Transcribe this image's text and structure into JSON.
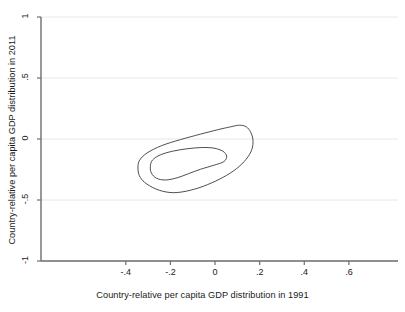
{
  "chart_data": {
    "type": "line",
    "title": "",
    "subtitle": "",
    "xlabel": "Country-relative per capita GDP distribution in 1991",
    "ylabel": "Country-relative per capita GDP distribution in 2011",
    "xlim": [
      -0.78,
      0.82
    ],
    "ylim": [
      -1.0,
      1.0
    ],
    "grid": true,
    "grid_axis": "y",
    "legend": "none",
    "xticks": [
      -0.4,
      -0.2,
      0,
      0.2,
      0.4,
      0.6
    ],
    "xtick_labels": [
      "-.4",
      "-.2",
      "0",
      ".2",
      ".4",
      ".6"
    ],
    "yticks": [
      1,
      0.5,
      0,
      -0.5,
      -1
    ],
    "ytick_labels": [
      "1",
      ".5",
      "0",
      "-.5",
      "-1"
    ],
    "series": [
      {
        "name": "outer-contour",
        "type": "closed-contour",
        "points": [
          [
            -0.345,
            -0.255
          ],
          [
            -0.34,
            -0.18
          ],
          [
            -0.305,
            -0.115
          ],
          [
            -0.24,
            -0.055
          ],
          [
            -0.155,
            -0.005
          ],
          [
            -0.065,
            0.04
          ],
          [
            0.01,
            0.075
          ],
          [
            0.07,
            0.1
          ],
          [
            0.11,
            0.113
          ],
          [
            0.14,
            0.1
          ],
          [
            0.16,
            0.055
          ],
          [
            0.17,
            -0.01
          ],
          [
            0.165,
            -0.085
          ],
          [
            0.14,
            -0.165
          ],
          [
            0.095,
            -0.245
          ],
          [
            0.035,
            -0.315
          ],
          [
            -0.035,
            -0.375
          ],
          [
            -0.11,
            -0.42
          ],
          [
            -0.185,
            -0.44
          ],
          [
            -0.25,
            -0.42
          ],
          [
            -0.305,
            -0.37
          ],
          [
            -0.335,
            -0.315
          ],
          [
            -0.345,
            -0.255
          ]
        ]
      },
      {
        "name": "inner-contour",
        "type": "closed-contour",
        "points": [
          [
            -0.29,
            -0.225
          ],
          [
            -0.28,
            -0.172
          ],
          [
            -0.245,
            -0.13
          ],
          [
            -0.19,
            -0.1
          ],
          [
            -0.125,
            -0.08
          ],
          [
            -0.06,
            -0.07
          ],
          [
            -0.005,
            -0.075
          ],
          [
            0.035,
            -0.1
          ],
          [
            0.052,
            -0.14
          ],
          [
            0.04,
            -0.185
          ],
          [
            -0.005,
            -0.215
          ],
          [
            -0.065,
            -0.248
          ],
          [
            -0.12,
            -0.285
          ],
          [
            -0.17,
            -0.318
          ],
          [
            -0.222,
            -0.336
          ],
          [
            -0.262,
            -0.322
          ],
          [
            -0.285,
            -0.28
          ],
          [
            -0.29,
            -0.225
          ]
        ]
      }
    ]
  },
  "colors": {
    "contour_line": "#3a3a3a",
    "axis_line": "#6e6e6e",
    "grid_line": "#e8e8e8",
    "text": "#1a1a1a",
    "background": "#ffffff"
  }
}
